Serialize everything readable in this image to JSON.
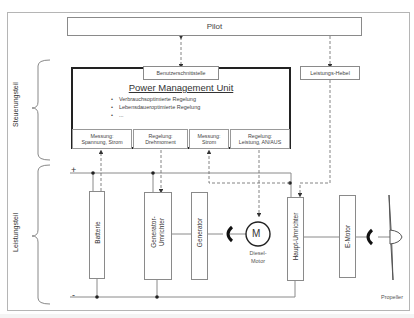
{
  "diagram": {
    "pilot": {
      "label": "Pilot"
    },
    "interface": {
      "label": "Benutzerschnittstelle"
    },
    "power_lever": {
      "label": "Leistungs-Hebel"
    },
    "pmu": {
      "title": "Power Management Unit",
      "bullets": [
        "Verbrauchsoptimierte Regelung",
        "Lebensdaueroptimierte Regelung",
        "..."
      ],
      "modules": [
        {
          "line1": "Messung:",
          "line2": "Spannung, Strom"
        },
        {
          "line1": "Regelung:",
          "line2": "Drehmoment"
        },
        {
          "line1": "Messung:",
          "line2": "Strom"
        },
        {
          "line1": "Regelung:",
          "line2": "Leistung, AN/AUS"
        }
      ]
    },
    "sections": {
      "control": "Steuerungsteil",
      "power": "Leistungsteil"
    },
    "bus": {
      "plus": "+",
      "minus": "-"
    },
    "components": {
      "battery": "Batterie",
      "gen_inverter": [
        "Generator-",
        "Umrichter"
      ],
      "generator": "Generator",
      "diesel_symbol": "M",
      "diesel_label": [
        "Diesel-",
        "Motor"
      ],
      "main_inverter": "Haupt-Umrichter",
      "emotor": "E-Motor",
      "propeller": "Propeller"
    },
    "colors": {
      "line": "#8a8a8a",
      "dash": "#777777",
      "pmu_border": "#222222",
      "text": "#333333"
    }
  }
}
